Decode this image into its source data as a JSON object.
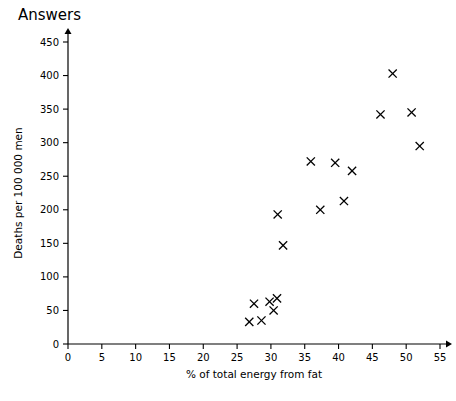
{
  "title": "Answers",
  "chart_data": {
    "type": "scatter",
    "title": "",
    "xlabel": "% of total energy from fat",
    "ylabel": "Deaths per 100 000 men",
    "xlim": [
      0,
      55
    ],
    "ylim": [
      0,
      450
    ],
    "xticks": [
      0,
      5,
      10,
      15,
      20,
      25,
      30,
      35,
      40,
      45,
      50,
      55
    ],
    "yticks": [
      0,
      50,
      100,
      150,
      200,
      250,
      300,
      350,
      400,
      450
    ],
    "grid": false,
    "legend": null,
    "marker": "x",
    "points": [
      {
        "x": 26.8,
        "y": 33
      },
      {
        "x": 27.5,
        "y": 60
      },
      {
        "x": 28.6,
        "y": 35
      },
      {
        "x": 29.8,
        "y": 63
      },
      {
        "x": 30.4,
        "y": 50
      },
      {
        "x": 30.9,
        "y": 68
      },
      {
        "x": 31.0,
        "y": 193
      },
      {
        "x": 31.8,
        "y": 147
      },
      {
        "x": 35.9,
        "y": 272
      },
      {
        "x": 37.3,
        "y": 200
      },
      {
        "x": 39.5,
        "y": 270
      },
      {
        "x": 40.8,
        "y": 213
      },
      {
        "x": 42.0,
        "y": 258
      },
      {
        "x": 46.2,
        "y": 342
      },
      {
        "x": 48.0,
        "y": 403
      },
      {
        "x": 50.8,
        "y": 345
      },
      {
        "x": 52.0,
        "y": 295
      }
    ]
  }
}
